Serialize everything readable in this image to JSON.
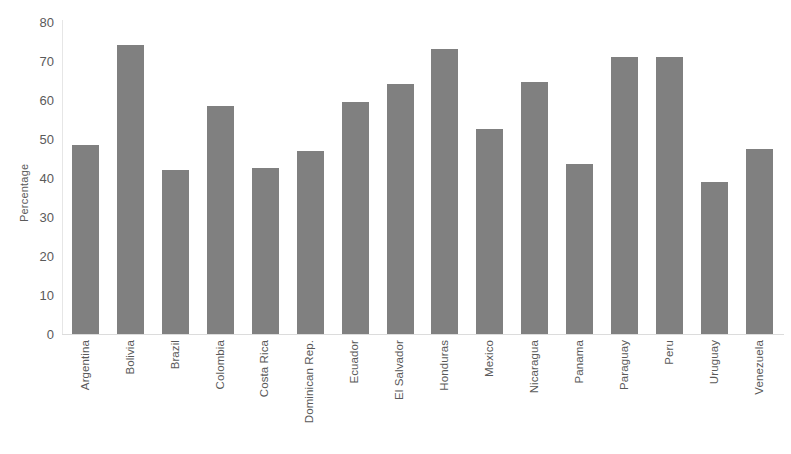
{
  "chart_data": {
    "type": "bar",
    "title": "",
    "subtitle": "",
    "xlabel": "",
    "ylabel": "Percentage",
    "ylim": [
      0,
      80
    ],
    "yticks": [
      0,
      10,
      20,
      30,
      40,
      50,
      60,
      70,
      80
    ],
    "ytick_labels": [
      "0",
      "10",
      "20",
      "30",
      "40",
      "50",
      "60",
      "70",
      "80"
    ],
    "grid": false,
    "legend": null,
    "legend_position": "none",
    "bar_color": "#808080",
    "axis_color": "#dcdcdc",
    "text_color": "#595959",
    "categories": [
      "Argentina",
      "Bolivia",
      "Brazil",
      "Colombia",
      "Costa Rica",
      "Dominican Rep.",
      "Ecuador",
      "El Salvador",
      "Honduras",
      "Mexico",
      "Nicaragua",
      "Panama",
      "Paraguay",
      "Peru",
      "Uruguay",
      "Venezuela"
    ],
    "values": [
      48.5,
      74,
      42,
      58.5,
      42.5,
      47,
      59.5,
      64,
      73,
      52.5,
      64.5,
      43.5,
      71,
      71,
      39,
      47.5
    ]
  }
}
